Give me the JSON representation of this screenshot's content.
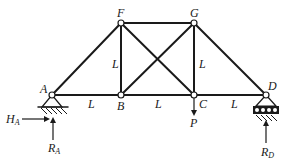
{
  "diagram": {
    "type": "truss",
    "nodes": [
      {
        "id": "A",
        "label": "A",
        "x": 52,
        "y": 95
      },
      {
        "id": "B",
        "label": "B",
        "x": 121,
        "y": 95
      },
      {
        "id": "C",
        "label": "C",
        "x": 194,
        "y": 95
      },
      {
        "id": "D",
        "label": "D",
        "x": 266,
        "y": 95
      },
      {
        "id": "F",
        "label": "F",
        "x": 121,
        "y": 23
      },
      {
        "id": "G",
        "label": "G",
        "x": 194,
        "y": 23
      }
    ],
    "members": [
      [
        "A",
        "B"
      ],
      [
        "B",
        "C"
      ],
      [
        "C",
        "D"
      ],
      [
        "F",
        "G"
      ],
      [
        "A",
        "F"
      ],
      [
        "B",
        "F"
      ],
      [
        "C",
        "G"
      ],
      [
        "G",
        "D"
      ],
      [
        "B",
        "G"
      ],
      [
        "F",
        "C"
      ]
    ],
    "dimension_labels": {
      "AB": "L",
      "BC": "L",
      "CD": "L",
      "BF": "L",
      "CG": "L"
    },
    "supports": {
      "A": "pin",
      "D": "roller"
    },
    "loads": {
      "P": {
        "label": "P",
        "at": "C",
        "direction": "down"
      }
    },
    "reactions": {
      "H_A": {
        "label": "H",
        "subscript": "A",
        "direction": "right"
      },
      "R_A": {
        "label": "R",
        "subscript": "A",
        "direction": "up"
      },
      "R_D": {
        "label": "R",
        "subscript": "D",
        "direction": "up"
      }
    }
  }
}
